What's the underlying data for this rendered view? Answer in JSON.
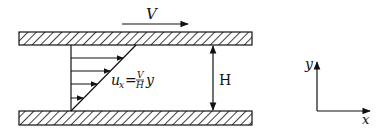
{
  "diagram": {
    "top_plate": {
      "velocity_label": "V"
    },
    "bottom_plate": {
      "label": ""
    },
    "profile": {
      "equation": {
        "lhs": "u",
        "lhs_sub": "x",
        "equals": "=",
        "num": "V",
        "den": "H",
        "var": "y"
      },
      "arrow_count": 4
    },
    "gap": {
      "label": "H"
    },
    "axes": {
      "x_label": "x",
      "y_label": "y"
    },
    "colors": {
      "stroke": "#111111",
      "background": "#ffffff"
    }
  }
}
